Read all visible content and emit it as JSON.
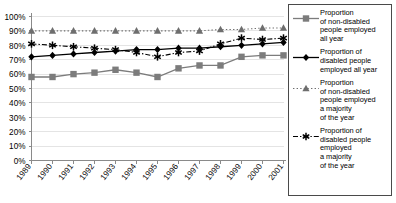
{
  "chart_data": {
    "type": "line",
    "title": "",
    "xlabel": "",
    "ylabel": "",
    "categories": [
      "1989",
      "1990",
      "1991",
      "1992",
      "1993",
      "1994",
      "1995",
      "1996",
      "1997",
      "1998",
      "1999",
      "2000",
      "2001"
    ],
    "ylim": [
      0,
      100
    ],
    "ytick_labels": [
      "0%",
      "10%",
      "20%",
      "30%",
      "40%",
      "50%",
      "60%",
      "70%",
      "80%",
      "90%",
      "100%"
    ],
    "ytick_values": [
      0,
      10,
      20,
      30,
      40,
      50,
      60,
      70,
      80,
      90,
      100
    ],
    "grid": true,
    "legend_position": "right",
    "series": [
      {
        "name": "Proportion\nof non-disabled\npeople employed\nall year",
        "marker": "square",
        "line_style": "solid",
        "color": "#7c7c7c",
        "values": [
          58,
          58,
          60,
          61,
          63,
          61,
          58,
          64,
          66,
          66,
          72,
          73,
          73
        ]
      },
      {
        "name": "Proportion of\ndisabled people\nemployed all year",
        "marker": "diamond",
        "line_style": "solid",
        "color": "#000000",
        "values": [
          72,
          73,
          74,
          75,
          76,
          77,
          77,
          78,
          78,
          79,
          80,
          81,
          82
        ]
      },
      {
        "name": "Proportion\nof  non-disabled\npeople employed\na majority\nof the year",
        "marker": "triangle",
        "line_style": "dotted",
        "color": "#6e6e6e",
        "values": [
          90,
          90,
          90,
          90,
          90,
          90,
          90,
          90,
          90,
          91,
          91,
          92,
          92
        ]
      },
      {
        "name": "Proportion of\ndisabled people\nemployed\na majority\nof the year",
        "marker": "asterisk",
        "line_style": "dash-dot",
        "color": "#000000",
        "values": [
          81,
          80,
          79,
          78,
          77,
          75,
          72,
          75,
          76,
          81,
          85,
          84,
          85
        ]
      }
    ]
  }
}
